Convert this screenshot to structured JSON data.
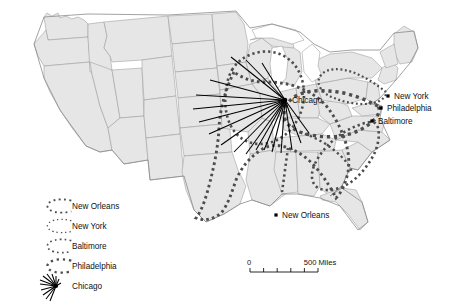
{
  "map": {
    "title": "Urban hinterlands of major United States ports and rail hubs",
    "background_color": "#ffffff",
    "land_fill": "#e6e6e6",
    "border_color": "#9a9a9a",
    "hinterland_color": "#4d4d4d",
    "hub_color": "#000000"
  },
  "cities": [
    {
      "name": "New York",
      "label": "New York",
      "x": 388,
      "y": 96,
      "label_dx": 6,
      "label_dy": 3
    },
    {
      "name": "Philadelphia",
      "label": "Philadelphia",
      "x": 381,
      "y": 108,
      "label_dx": 6,
      "label_dy": 3
    },
    {
      "name": "Baltimore",
      "label": "Baltimore",
      "x": 372,
      "y": 121,
      "label_dx": 6,
      "label_dy": 3
    },
    {
      "name": "New Orleans",
      "label": "New Orleans",
      "x": 276,
      "y": 215,
      "label_dx": 6,
      "label_dy": 3
    },
    {
      "name": "Chicago",
      "label": "Chicago",
      "x": 285,
      "y": 100,
      "label_dx": 7,
      "label_dy": 3
    }
  ],
  "hub": {
    "name": "Chicago",
    "x": 285,
    "y": 100,
    "ray_count": 18,
    "ray_endpoints": [
      [
        231,
        57
      ],
      [
        246,
        60
      ],
      [
        262,
        63
      ],
      [
        210,
        80
      ],
      [
        196,
        95
      ],
      [
        193,
        109
      ],
      [
        199,
        122
      ],
      [
        209,
        134
      ],
      [
        221,
        145
      ],
      [
        234,
        152
      ],
      [
        246,
        154
      ],
      [
        256,
        150
      ],
      [
        264,
        150
      ],
      [
        272,
        152
      ],
      [
        281,
        153
      ],
      [
        292,
        150
      ],
      [
        301,
        143
      ],
      [
        309,
        133
      ]
    ]
  },
  "legend": {
    "items": [
      {
        "label": "New Orleans",
        "symbol": "dotted-loop",
        "dot_size": 1.9,
        "dot_gap": 3.4
      },
      {
        "label": "New York",
        "symbol": "dotted-loop",
        "dot_size": 1.3,
        "dot_gap": 3.0
      },
      {
        "label": "Baltimore",
        "symbol": "dotted-loop",
        "dot_size": 1.7,
        "dot_gap": 3.2
      },
      {
        "label": "Philadelphia",
        "symbol": "dotted-loop",
        "dot_size": 2.3,
        "dot_gap": 3.8
      },
      {
        "label": "Chicago",
        "symbol": "starburst",
        "dot_size": 0,
        "dot_gap": 0
      }
    ]
  },
  "scale_bar": {
    "start_label": "0",
    "end_label": "500 Miles",
    "segments": 5,
    "x": 250,
    "y": 272,
    "width": 68
  },
  "hinterland_boundaries": [
    {
      "city": "New Orleans",
      "dash": "2.6 3.2",
      "width": 2.9
    },
    {
      "city": "New York",
      "dash": "1.9 2.6",
      "width": 2.2
    },
    {
      "city": "Baltimore",
      "dash": "2.3 3.0",
      "width": 2.6
    },
    {
      "city": "Philadelphia",
      "dash": "3.2 3.8",
      "width": 3.4
    }
  ]
}
